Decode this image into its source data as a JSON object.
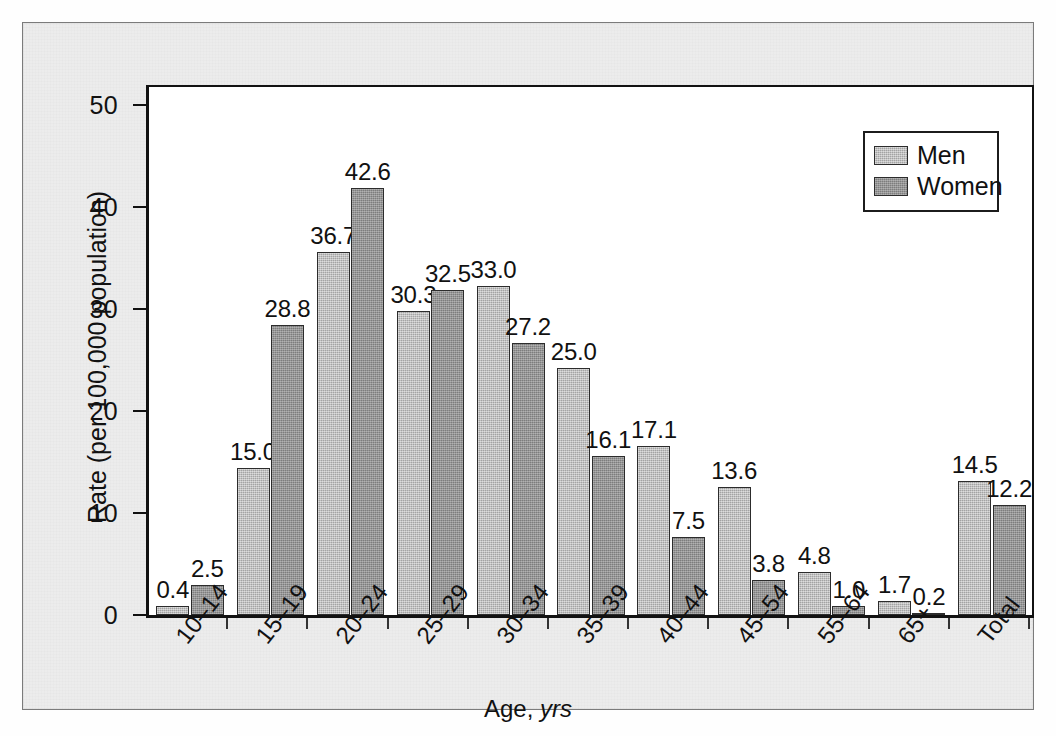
{
  "chart_data": {
    "type": "bar",
    "title": "",
    "xlabel": "Age, yrs",
    "ylabel": "Rate (per 100,000 population)",
    "ylim": [
      0,
      52
    ],
    "yticks": [
      0,
      10,
      20,
      30,
      40,
      50
    ],
    "ytick_labels": [
      "0",
      "10",
      "20",
      "30",
      "40",
      "50"
    ],
    "grid": false,
    "legend_position": "top-right",
    "categories": [
      "10–14",
      "15–19",
      "20–24",
      "25–29",
      "30–34",
      "35–39",
      "40–44",
      "45–54",
      "55–64",
      "65+",
      "Total"
    ],
    "series": [
      {
        "name": "Men",
        "color": "#b3b3b3",
        "values": [
          0.4,
          15.0,
          36.7,
          30.3,
          33.0,
          25.0,
          17.1,
          13.6,
          4.8,
          1.7,
          14.5
        ],
        "labels": [
          "0.4",
          "15.0",
          "36.7",
          "30.3",
          "33.0",
          "25.0",
          "17.1",
          "13.6",
          "4.8",
          "1.7",
          "14.5"
        ],
        "drawn_heights": [
          0.9,
          14.4,
          35.6,
          29.8,
          32.3,
          24.2,
          16.6,
          12.6,
          4.2,
          1.4,
          13.1
        ]
      },
      {
        "name": "Women",
        "color": "#8c8c8c",
        "values": [
          2.5,
          28.8,
          42.6,
          32.5,
          27.2,
          16.1,
          7.5,
          3.8,
          1.0,
          0.2,
          12.2
        ],
        "labels": [
          "2.5",
          "28.8",
          "42.6",
          "32.5",
          "27.2",
          "16.1",
          "7.5",
          "3.8",
          "1.0",
          "0.2",
          "12.2"
        ],
        "drawn_heights": [
          2.9,
          28.5,
          41.9,
          31.9,
          26.7,
          15.6,
          7.7,
          3.4,
          0.9,
          0.15,
          10.8
        ]
      }
    ]
  },
  "legend": {
    "entries": [
      {
        "label": "Men"
      },
      {
        "label": "Women"
      }
    ]
  }
}
